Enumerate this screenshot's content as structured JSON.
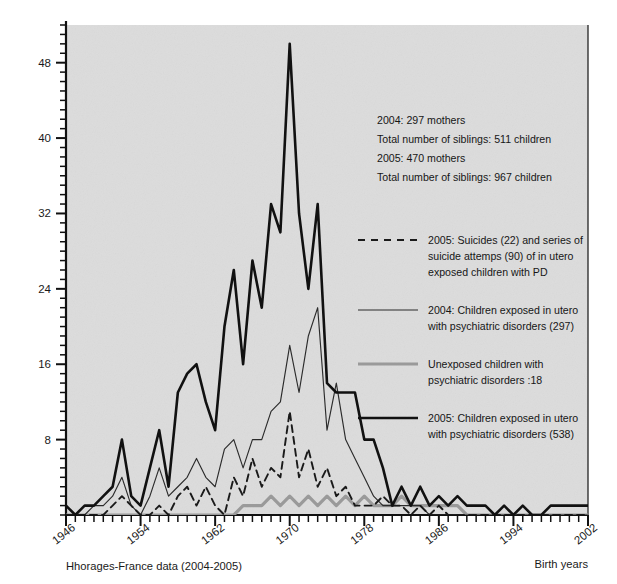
{
  "figure": {
    "caption": "Hhorages-France data (2004-2005)",
    "xlabel": "Birth years",
    "ylabel": "Case number",
    "background": "#dcdcdc",
    "page_background": "#ffffff"
  },
  "annotation": {
    "lines": [
      "2004: 297 mothers",
      "Total number of siblings: 511 children",
      "2005: 470 mothers",
      "Total number of siblings: 967 children"
    ]
  },
  "legend": {
    "entries": [
      {
        "style": "dashed",
        "color": "#1a1a1a",
        "lines": [
          "2005: Suicides (22) and series of",
          "suicide attemps (90) of in utero",
          "exposed children with PD"
        ]
      },
      {
        "style": "thin",
        "color": "#2b2b2b",
        "lines": [
          "2004: Children exposed in utero",
          "with psychiatric disorders (297)"
        ]
      },
      {
        "style": "grey",
        "color": "#9a9a9a",
        "lines": [
          "Unexposed children with",
          "psychiatric disorders :18"
        ]
      },
      {
        "style": "thick",
        "color": "#111111",
        "lines": [
          "2005: Children exposed in utero",
          "with psychiatric disorders (538)"
        ]
      }
    ]
  },
  "chart_data": {
    "type": "line",
    "title": "",
    "xlabel": "Birth years",
    "ylabel": "Case number",
    "xlim": [
      1946,
      2002
    ],
    "ylim": [
      0,
      52
    ],
    "yticks": [
      8,
      16,
      24,
      32,
      40,
      48
    ],
    "xticks": [
      1946,
      1954,
      1962,
      1970,
      1978,
      1986,
      1994,
      2002
    ],
    "xtick_minor_step": 1,
    "ytick_minor_step": 1,
    "grid": false,
    "legend_position": "right-inside",
    "x": [
      1946,
      1947,
      1948,
      1949,
      1950,
      1951,
      1952,
      1953,
      1954,
      1955,
      1956,
      1957,
      1958,
      1959,
      1960,
      1961,
      1962,
      1963,
      1964,
      1965,
      1966,
      1967,
      1968,
      1969,
      1970,
      1971,
      1972,
      1973,
      1974,
      1975,
      1976,
      1977,
      1978,
      1979,
      1980,
      1981,
      1982,
      1983,
      1984,
      1985,
      1986,
      1987,
      1988,
      1989,
      1990,
      1991,
      1992,
      1993,
      1994,
      1995,
      1996,
      1997,
      1998,
      1999,
      2000,
      2001,
      2002
    ],
    "series": [
      {
        "name": "2005: Children exposed in utero with psychiatric disorders (538)",
        "style": "thick",
        "color": "#111111",
        "values": [
          1,
          0,
          1,
          1,
          2,
          3,
          8,
          2,
          1,
          5,
          9,
          3,
          13,
          15,
          16,
          12,
          9,
          20,
          26,
          16,
          27,
          22,
          33,
          30,
          50,
          32,
          24,
          33,
          14,
          13,
          13,
          13,
          8,
          8,
          5,
          1,
          3,
          1,
          3,
          1,
          2,
          1,
          2,
          1,
          1,
          1,
          0,
          1,
          0,
          1,
          0,
          0,
          1,
          1,
          1,
          1,
          1
        ]
      },
      {
        "name": "2004: Children exposed in utero with psychiatric disorders (297)",
        "style": "thin",
        "color": "#2b2b2b",
        "values": [
          0,
          0,
          0,
          1,
          1,
          2,
          4,
          1,
          0,
          2,
          5,
          2,
          3,
          4,
          6,
          4,
          3,
          7,
          8,
          5,
          8,
          8,
          11,
          12,
          18,
          13,
          19,
          22,
          9,
          14,
          8,
          6,
          4,
          2,
          1,
          1,
          1,
          1,
          1,
          0,
          0,
          0,
          0,
          0,
          0,
          0,
          0,
          0,
          0,
          0,
          0,
          0,
          0,
          0,
          0,
          0,
          0
        ]
      },
      {
        "name": "2005: Suicides (22) and series of suicide attemps (90) of in utero exposed children with PD",
        "style": "dashed",
        "color": "#1a1a1a",
        "values": [
          0,
          0,
          0,
          0,
          0,
          1,
          2,
          1,
          0,
          0,
          1,
          0,
          2,
          3,
          1,
          3,
          1,
          0,
          4,
          2,
          6,
          3,
          5,
          4,
          11,
          4,
          7,
          3,
          5,
          2,
          3,
          1,
          1,
          1,
          2,
          1,
          1,
          0,
          1,
          0,
          1,
          0,
          0,
          0,
          0,
          0,
          0,
          0,
          0,
          0,
          0,
          0,
          0,
          0,
          0,
          0,
          0
        ]
      },
      {
        "name": "Unexposed children with psychiatric disorders :18",
        "style": "grey",
        "color": "#9a9a9a",
        "values": [
          0,
          0,
          0,
          0,
          0,
          0,
          0,
          0,
          0,
          0,
          0,
          0,
          0,
          0,
          0,
          0,
          0,
          0,
          0,
          1,
          1,
          1,
          2,
          1,
          2,
          1,
          2,
          1,
          2,
          1,
          2,
          1,
          2,
          1,
          1,
          1,
          2,
          1,
          1,
          1,
          1,
          1,
          1,
          0,
          0,
          0,
          0,
          0,
          0,
          0,
          0,
          0,
          0,
          0,
          0,
          0,
          0
        ]
      }
    ]
  }
}
